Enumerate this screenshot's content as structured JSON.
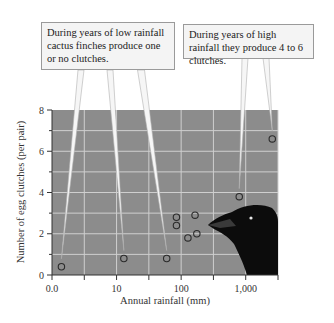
{
  "chart_data": {
    "type": "scatter",
    "title": "",
    "xlabel": "Annual rainfall (mm)",
    "ylabel": "Number of egg clutches (per pair)",
    "x_scale": "log",
    "x_tick_labels": [
      "0.0",
      "10",
      "100",
      "1,000"
    ],
    "y_tick_labels": [
      "0",
      "2",
      "4",
      "6",
      "8"
    ],
    "ylim": [
      0,
      8
    ],
    "xlim_log10": [
      0,
      3.5
    ],
    "grid": true,
    "points": [
      {
        "x": 1.4,
        "y": 0.4
      },
      {
        "x": 13,
        "y": 0.8
      },
      {
        "x": 60,
        "y": 0.8
      },
      {
        "x": 85,
        "y": 2.8
      },
      {
        "x": 85,
        "y": 2.4
      },
      {
        "x": 165,
        "y": 2.9
      },
      {
        "x": 128,
        "y": 1.8
      },
      {
        "x": 176,
        "y": 2.0
      },
      {
        "x": 800,
        "y": 3.8
      },
      {
        "x": 2600,
        "y": 6.6
      }
    ],
    "annotations": [
      {
        "id": "low",
        "text": "During years of low rainfall cactus finches produce one or no clutches.",
        "points": [
          0,
          1,
          2
        ]
      },
      {
        "id": "high",
        "text": "During years of high rainfall they produce 4 to 6 clutches.",
        "points": [
          8,
          9
        ]
      }
    ]
  },
  "callouts": {
    "low": "During years of low rainfall cactus finches produce one or no clutches.",
    "high": "During years of high rainfall they produce 4 to 6 clutches."
  },
  "colors": {
    "plot_bg": "#8c8c8c",
    "grid": "#cfcfcf",
    "marker": "#2b2b2b",
    "bird": "#0c0c0c",
    "callout_bg": "#f4f4f4"
  }
}
